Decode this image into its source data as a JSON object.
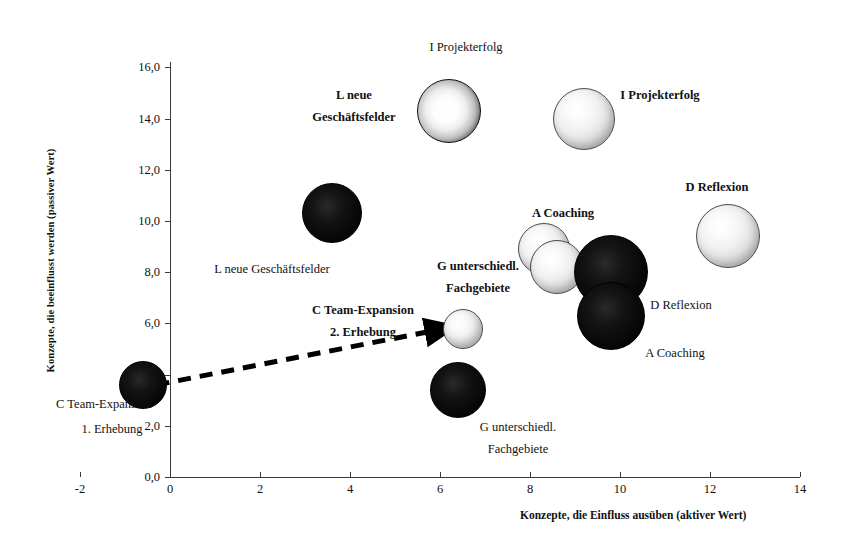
{
  "chart_data": {
    "type": "scatter",
    "title": "",
    "xlabel": "Konzepte, die Einfluss ausüben (aktiver Wert)",
    "ylabel": "Konzepte, die beeinflusst werden (passiver Wert)",
    "xlim": [
      -2,
      14
    ],
    "ylim": [
      0.0,
      16.0
    ],
    "xticks": [
      "-2",
      "0",
      "2",
      "4",
      "6",
      "8",
      "10",
      "12",
      "14"
    ],
    "xtick_values": [
      -2,
      0,
      2,
      4,
      6,
      8,
      10,
      12,
      14
    ],
    "yticks": [
      "0,0",
      "2,0",
      "4,0",
      "6,0",
      "8,0",
      "10,0",
      "12,0",
      "14,0",
      "16,0"
    ],
    "ytick_values": [
      0,
      2,
      4,
      6,
      8,
      10,
      12,
      14,
      16
    ],
    "grid": false,
    "legend": "none",
    "points": [
      {
        "label": "L neue Geschäftsfelder",
        "series": "2. Erhebung",
        "x": 6.2,
        "y": 14.3,
        "size": 31,
        "fill": "ring"
      },
      {
        "label": "I Projekterfolg",
        "series": "2. Erhebung",
        "x": 9.2,
        "y": 14.0,
        "size": 30,
        "fill": "light"
      },
      {
        "label": "L neue Geschäftsfelder",
        "series": "1. Erhebung",
        "x": 3.6,
        "y": 10.3,
        "size": 29,
        "fill": "dark"
      },
      {
        "label": "D Reflexion",
        "series": "2. Erhebung",
        "x": 12.4,
        "y": 9.4,
        "size": 31,
        "fill": "light"
      },
      {
        "label": "A Coaching",
        "series": "2. Erhebung",
        "x": 8.3,
        "y": 8.9,
        "size": 25,
        "fill": "light"
      },
      {
        "label": "G unterschiedl. Fachgebiete",
        "series": "2. Erhebung",
        "x": 8.6,
        "y": 8.2,
        "size": 26,
        "fill": "light"
      },
      {
        "label": "D Reflexion",
        "series": "1. Erhebung",
        "x": 9.8,
        "y": 8.0,
        "size": 36,
        "fill": "dark"
      },
      {
        "label": "A Coaching",
        "series": "1. Erhebung",
        "x": 9.8,
        "y": 6.3,
        "size": 33,
        "fill": "dark"
      },
      {
        "label": "C Team-Expansion 2. Erhebung",
        "series": "2. Erhebung",
        "x": 6.5,
        "y": 5.8,
        "size": 19,
        "fill": "light"
      },
      {
        "label": "C Team-Expansion 1. Erhebung",
        "series": "1. Erhebung",
        "x": -0.6,
        "y": 3.6,
        "size": 23,
        "fill": "dark"
      },
      {
        "label": "G unterschiedl. Fachgebiete",
        "series": "1. Erhebung",
        "x": 6.4,
        "y": 3.4,
        "size": 27,
        "fill": "dark"
      }
    ],
    "annotations": [
      {
        "name": "shift-arrow",
        "type": "dashed-arrow",
        "from_x": -0.3,
        "from_y": 3.6,
        "to_x": 6.25,
        "to_y": 5.85,
        "note": "C Team-Expansion Verschiebung von 1. zu 2. Erhebung"
      }
    ],
    "point_labels": [
      {
        "id": "lbl-i-projekterfolg-top",
        "text": "I Projekterfolg",
        "bold": false,
        "x": 466,
        "y": 40,
        "align": "center"
      },
      {
        "id": "lbl-l-neue-bold-1",
        "text": "L neue",
        "bold": true,
        "x": 354,
        "y": 88,
        "align": "center"
      },
      {
        "id": "lbl-l-neue-bold-2",
        "text": "Geschäftsfelder",
        "bold": true,
        "x": 354,
        "y": 110,
        "align": "center"
      },
      {
        "id": "lbl-i-projekterfolg-right",
        "text": "I Projekterfolg",
        "bold": true,
        "x": 660,
        "y": 88,
        "align": "center"
      },
      {
        "id": "lbl-d-reflexion-bold",
        "text": "D Reflexion",
        "bold": true,
        "x": 717,
        "y": 180,
        "align": "center"
      },
      {
        "id": "lbl-a-coaching-bold",
        "text": "A Coaching",
        "bold": true,
        "x": 563,
        "y": 206,
        "align": "center"
      },
      {
        "id": "lbl-l-neue-plain",
        "text": "L neue Geschäftsfelder",
        "bold": false,
        "x": 272,
        "y": 262,
        "align": "center"
      },
      {
        "id": "lbl-g-unterschiedl-b1",
        "text": "G unterschiedl.",
        "bold": true,
        "x": 478,
        "y": 259,
        "align": "center"
      },
      {
        "id": "lbl-g-unterschiedl-b2",
        "text": "Fachgebiete",
        "bold": true,
        "x": 478,
        "y": 281,
        "align": "center"
      },
      {
        "id": "lbl-c-team-b1",
        "text": "C Team-Expansion",
        "bold": true,
        "x": 363,
        "y": 303,
        "align": "center"
      },
      {
        "id": "lbl-c-team-b2",
        "text": "2. Erhebung",
        "bold": true,
        "x": 363,
        "y": 325,
        "align": "center"
      },
      {
        "id": "lbl-d-reflexion-plain",
        "text": "D Reflexion",
        "bold": false,
        "x": 681,
        "y": 298,
        "align": "center"
      },
      {
        "id": "lbl-a-coaching-plain",
        "text": "A Coaching",
        "bold": false,
        "x": 675,
        "y": 346,
        "align": "center"
      },
      {
        "id": "lbl-c-team-p1",
        "text": "C Team-Expansion",
        "bold": false,
        "x": 104,
        "y": 397,
        "align": "center"
      },
      {
        "id": "lbl-c-team-p2",
        "text": "1. Erhebung",
        "bold": false,
        "x": 112,
        "y": 422,
        "align": "center"
      },
      {
        "id": "lbl-g-untersch-p1",
        "text": "G unterschiedl.",
        "bold": false,
        "x": 518,
        "y": 420,
        "align": "center"
      },
      {
        "id": "lbl-g-untersch-p2",
        "text": "Fachgebiete",
        "bold": false,
        "x": 518,
        "y": 442,
        "align": "center"
      }
    ],
    "colors": {
      "axis": "#3a3a3a",
      "text": "#111111",
      "bubble_dark": "#000000",
      "bubble_light": "#e8e8e8",
      "background": "#ffffff"
    }
  }
}
